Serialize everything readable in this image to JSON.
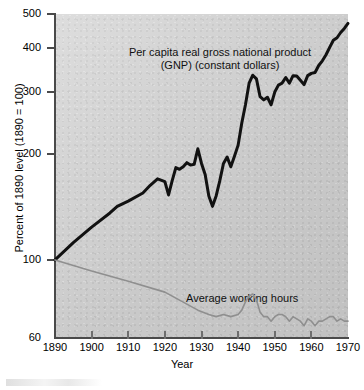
{
  "chart_data": {
    "type": "line",
    "title": "",
    "xlabel": "Year",
    "ylabel": "Percent of 1890 level (1890 = 100)",
    "yscale": "log",
    "ylim": [
      60,
      500
    ],
    "xlim": [
      1890,
      1970
    ],
    "grid": false,
    "legend": "inline annotations",
    "ytick_labels": [
      "500",
      "400",
      "300",
      "200",
      "100",
      "60"
    ],
    "ytick_values": [
      500,
      400,
      300,
      200,
      100,
      60
    ],
    "xtick_labels": [
      "1890",
      "1900",
      "1910",
      "1920",
      "1930",
      "1940",
      "1950",
      "1960",
      "1970"
    ],
    "xtick_values": [
      1890,
      1900,
      1910,
      1920,
      1930,
      1940,
      1950,
      1960,
      1970
    ],
    "annotations": [
      {
        "name": "gnp-label",
        "line1": "Per capita real gross national product",
        "line2": "(GNP) (constant dollars)"
      },
      {
        "name": "hours-label",
        "text": "Average working hours"
      }
    ],
    "series": [
      {
        "name": "Per capita real gross national product (GNP) (constant dollars)",
        "color": "#111111",
        "width": 3.0,
        "x": [
          1890,
          1895,
          1900,
          1905,
          1907,
          1910,
          1914,
          1916,
          1918,
          1920,
          1921,
          1922,
          1923,
          1924,
          1925,
          1926,
          1927,
          1928,
          1929,
          1930,
          1931,
          1932,
          1933,
          1934,
          1935,
          1936,
          1937,
          1938,
          1939,
          1940,
          1941,
          1942,
          1943,
          1944,
          1945,
          1946,
          1947,
          1948,
          1949,
          1950,
          1951,
          1952,
          1953,
          1954,
          1955,
          1956,
          1957,
          1958,
          1959,
          1960,
          1961,
          1962,
          1963,
          1964,
          1965,
          1966,
          1967,
          1968,
          1969,
          1970
        ],
        "y": [
          100,
          112,
          124,
          136,
          142,
          147,
          155,
          163,
          170,
          167,
          153,
          168,
          183,
          181,
          184,
          189,
          186,
          187,
          207,
          188,
          175,
          152,
          142,
          152,
          168,
          188,
          196,
          184,
          197,
          212,
          245,
          276,
          318,
          335,
          327,
          291,
          285,
          290,
          276,
          300,
          314,
          318,
          330,
          318,
          334,
          333,
          324,
          315,
          334,
          339,
          341,
          357,
          368,
          383,
          402,
          421,
          428,
          443,
          455,
          470
        ]
      },
      {
        "name": "Average working hours",
        "color": "#8f8f8f",
        "width": 1.6,
        "x": [
          1890,
          1900,
          1910,
          1920,
          1929,
          1932,
          1934,
          1936,
          1938,
          1940,
          1941,
          1942,
          1943,
          1944,
          1945,
          1946,
          1947,
          1948,
          1949,
          1950,
          1951,
          1952,
          1953,
          1954,
          1955,
          1956,
          1957,
          1958,
          1959,
          1960,
          1961,
          1962,
          1963,
          1964,
          1965,
          1966,
          1967,
          1968,
          1969,
          1970
        ],
        "y": [
          100,
          93,
          87,
          81,
          72,
          70,
          69,
          70,
          69,
          70,
          72,
          76,
          79,
          80,
          77,
          71,
          69,
          69,
          67,
          69,
          70,
          70,
          69,
          67,
          69,
          68,
          67,
          65,
          68,
          67,
          65,
          67,
          67,
          68,
          69,
          69,
          67,
          68,
          67,
          67
        ]
      }
    ]
  }
}
